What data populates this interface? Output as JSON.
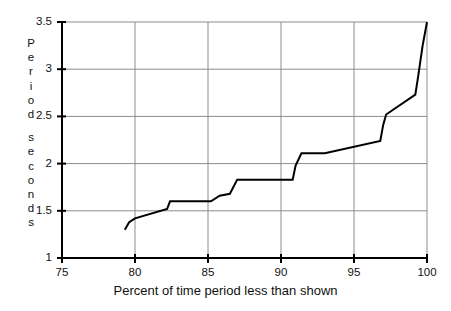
{
  "chart_data": {
    "type": "line",
    "title": "",
    "subtitle": "",
    "xlabel": "Percent of time period less than shown",
    "ylabel": "Period seconds",
    "ylabel_lines": [
      "Period",
      "seconds"
    ],
    "xlim": [
      75,
      100
    ],
    "ylim": [
      1,
      3.5
    ],
    "xticks": [
      75,
      80,
      85,
      90,
      95,
      100
    ],
    "xtick_labels": [
      "75",
      "80",
      "85",
      "90",
      "95",
      "100"
    ],
    "yticks": [
      1,
      1.5,
      2,
      2.5,
      3,
      3.5
    ],
    "ytick_labels": [
      "1",
      "1.5",
      "2",
      "2.5",
      "3",
      "3.5"
    ],
    "grid": true,
    "legend": null,
    "line_color": "#000000",
    "grid_color": "#8c8c8c",
    "axis_color": "#000000",
    "series": [
      {
        "name": "Period distribution",
        "points": [
          [
            79.3,
            1.3
          ],
          [
            79.6,
            1.38
          ],
          [
            80.0,
            1.42
          ],
          [
            82.2,
            1.52
          ],
          [
            82.4,
            1.6
          ],
          [
            85.2,
            1.6
          ],
          [
            85.8,
            1.66
          ],
          [
            86.5,
            1.68
          ],
          [
            87.0,
            1.83
          ],
          [
            90.8,
            1.83
          ],
          [
            91.0,
            1.98
          ],
          [
            91.4,
            2.11
          ],
          [
            93.0,
            2.11
          ],
          [
            96.8,
            2.24
          ],
          [
            97.0,
            2.41
          ],
          [
            97.2,
            2.52
          ],
          [
            99.2,
            2.73
          ],
          [
            99.4,
            2.93
          ],
          [
            99.7,
            3.25
          ],
          [
            100.0,
            3.5
          ]
        ]
      }
    ]
  }
}
